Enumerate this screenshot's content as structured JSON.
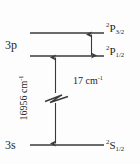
{
  "diagram": {
    "type": "energy-level-diagram",
    "colors": {
      "background": "#fdfdfd",
      "line": "#3a3a3a",
      "text": "#1f1f1f"
    },
    "shell_labels": [
      {
        "id": "3p",
        "text": "3p"
      },
      {
        "id": "3s",
        "text": "3s"
      }
    ],
    "levels": [
      {
        "id": "p32",
        "shell": "3p",
        "term_prefix": "2",
        "term_letter": "P",
        "term_j": "3/2",
        "label_text": "2P3/2"
      },
      {
        "id": "p12",
        "shell": "3p",
        "term_prefix": "2",
        "term_letter": "P",
        "term_j": "1/2",
        "label_text": "2P1/2"
      },
      {
        "id": "s12",
        "shell": "3s",
        "term_prefix": "2",
        "term_letter": "S",
        "term_j": "1/2",
        "label_text": "2S1/2"
      }
    ],
    "measurements": [
      {
        "id": "main-transition",
        "value": "16956",
        "unit": "cm",
        "unit_exponent": "-1",
        "text": "16956 cm",
        "orientation": "vertical",
        "between": [
          "s12",
          "p12"
        ]
      },
      {
        "id": "fine-splitting",
        "value": "17",
        "unit": "cm",
        "unit_exponent": "-1",
        "text": "17 cm",
        "orientation": "horizontal",
        "between": [
          "p12",
          "p32"
        ]
      }
    ]
  }
}
